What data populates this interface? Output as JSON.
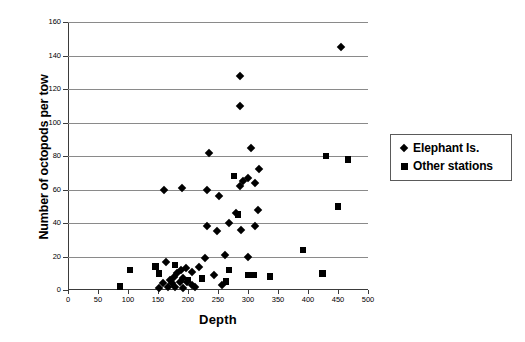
{
  "chart_data": {
    "type": "scatter",
    "title": "",
    "xlabel": "Depth",
    "ylabel": "Number of octopods per tow",
    "xlim": [
      0,
      500
    ],
    "ylim": [
      0,
      160
    ],
    "xticks": [
      0,
      50,
      100,
      150,
      200,
      250,
      300,
      350,
      400,
      450,
      500
    ],
    "yticks": [
      0,
      20,
      40,
      60,
      80,
      100,
      120,
      140,
      160
    ],
    "grid": "horizontal",
    "legend_position": "right-outside",
    "series": [
      {
        "name": "Elephant Is.",
        "marker": "diamond",
        "color": "#000000",
        "points": [
          [
            455,
            145
          ],
          [
            287,
            128
          ],
          [
            287,
            110
          ],
          [
            305,
            85
          ],
          [
            235,
            82
          ],
          [
            318,
            72
          ],
          [
            300,
            67
          ],
          [
            292,
            65
          ],
          [
            312,
            64
          ],
          [
            287,
            62
          ],
          [
            190,
            61
          ],
          [
            160,
            60
          ],
          [
            232,
            60
          ],
          [
            252,
            56
          ],
          [
            316,
            48
          ],
          [
            280,
            46
          ],
          [
            268,
            40
          ],
          [
            232,
            38
          ],
          [
            312,
            38
          ],
          [
            288,
            36
          ],
          [
            248,
            35
          ],
          [
            262,
            21
          ],
          [
            300,
            20
          ],
          [
            228,
            19
          ],
          [
            164,
            17
          ],
          [
            218,
            14
          ],
          [
            196,
            13
          ],
          [
            188,
            12
          ],
          [
            206,
            11
          ],
          [
            182,
            10
          ],
          [
            243,
            9
          ],
          [
            176,
            8
          ],
          [
            192,
            7
          ],
          [
            170,
            6
          ],
          [
            186,
            5
          ],
          [
            199,
            5
          ],
          [
            158,
            4
          ],
          [
            173,
            4
          ],
          [
            206,
            3
          ],
          [
            256,
            3
          ],
          [
            178,
            2
          ],
          [
            166,
            2
          ],
          [
            211,
            2
          ],
          [
            152,
            1
          ],
          [
            192,
            1
          ]
        ]
      },
      {
        "name": "Other stations",
        "marker": "square",
        "color": "#000000",
        "points": [
          [
            430,
            80
          ],
          [
            467,
            78
          ],
          [
            450,
            50
          ],
          [
            277,
            68
          ],
          [
            283,
            45
          ],
          [
            392,
            24
          ],
          [
            103,
            12
          ],
          [
            268,
            12
          ],
          [
            424,
            10
          ],
          [
            300,
            9
          ],
          [
            310,
            9
          ],
          [
            337,
            8
          ],
          [
            223,
            7
          ],
          [
            263,
            5
          ],
          [
            87,
            2
          ],
          [
            146,
            14
          ],
          [
            152,
            10
          ],
          [
            200,
            6
          ],
          [
            178,
            15
          ]
        ]
      }
    ]
  },
  "legend": {
    "items": [
      {
        "label": "Elephant Is.",
        "marker": "diamond"
      },
      {
        "label": "Other stations",
        "marker": "square"
      }
    ]
  }
}
